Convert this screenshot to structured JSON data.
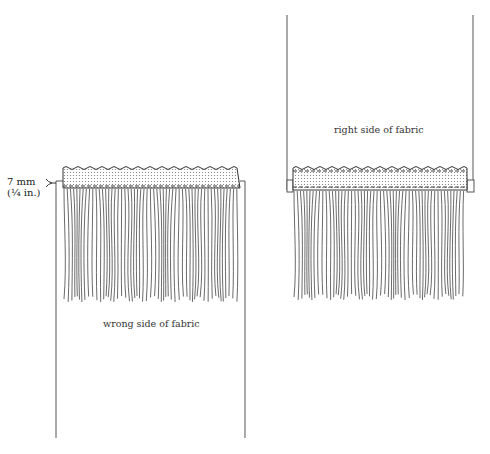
{
  "diagram": {
    "left_panel": {
      "caption": "wrong side of fabric",
      "measurement": {
        "metric": "7 mm",
        "imperial": "(¼ in.)"
      }
    },
    "right_panel": {
      "caption": "right side of fabric"
    },
    "colors": {
      "line": "#333333",
      "tape_fill": "#e6e6e6",
      "background": "#ffffff"
    }
  }
}
